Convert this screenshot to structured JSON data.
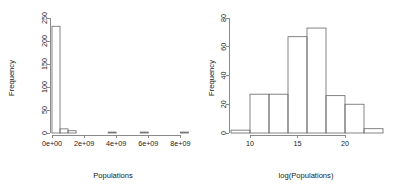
{
  "figure": {
    "background_color": "#ffffff",
    "axis_color": "#7d7d7d",
    "bar_outline_color": "#6f6f6f",
    "text_color": "#1a1a1a",
    "panel_count": 2
  },
  "chart_data": [
    {
      "type": "bar",
      "id": "histogram-populations",
      "title": "",
      "xlabel": "Populations",
      "ylabel": "Frequency",
      "grid": false,
      "legend": false,
      "xlim": [
        0,
        8600000000
      ],
      "ylim": [
        0,
        250
      ],
      "xticks": [
        0,
        2000000000,
        4000000000,
        6000000000,
        8000000000
      ],
      "xtick_labels": [
        "0e+00",
        "2e+09",
        "4e+09",
        "6e+09",
        "8e+09"
      ],
      "yticks": [
        0,
        50,
        100,
        150,
        200,
        250
      ],
      "ytick_labels": [
        "0",
        "50",
        "100",
        "150",
        "200",
        "250"
      ],
      "bin_width": 500000000,
      "bin_edges": [
        0,
        500000000,
        1000000000,
        1500000000,
        2000000000,
        2500000000,
        3000000000,
        3500000000,
        4000000000,
        4500000000,
        5000000000,
        5500000000,
        6000000000,
        6500000000,
        7000000000,
        7500000000,
        8000000000,
        8500000000
      ],
      "categories": [
        "0.0e+09",
        "0.5e+09",
        "1.0e+09",
        "1.5e+09",
        "2.0e+09",
        "2.5e+09",
        "3.0e+09",
        "3.5e+09",
        "4.0e+09",
        "4.5e+09",
        "5.0e+09",
        "5.5e+09",
        "6.0e+09",
        "6.5e+09",
        "7.0e+09",
        "7.5e+09",
        "8.0e+09"
      ],
      "values": [
        232,
        9,
        5,
        0,
        0,
        0,
        0,
        2,
        0,
        0,
        0,
        2,
        0,
        0,
        0,
        0,
        2
      ]
    },
    {
      "type": "bar",
      "id": "histogram-log-populations",
      "title": "",
      "xlabel": "log(Populations)",
      "ylabel": "Frequency",
      "grid": false,
      "legend": false,
      "xlim": [
        8,
        24
      ],
      "ylim": [
        0,
        80
      ],
      "xticks": [
        10,
        15,
        20
      ],
      "xtick_labels": [
        "10",
        "15",
        "20"
      ],
      "yticks": [
        0,
        20,
        40,
        60,
        80
      ],
      "ytick_labels": [
        "0",
        "20",
        "40",
        "60",
        "80"
      ],
      "bin_width": 2,
      "bin_edges": [
        8,
        10,
        12,
        14,
        16,
        18,
        20,
        22,
        24
      ],
      "categories": [
        "8-10",
        "10-12",
        "12-14",
        "14-16",
        "16-18",
        "18-20",
        "20-22",
        "22-24"
      ],
      "values": [
        2,
        27,
        27,
        67,
        73,
        26,
        20,
        3
      ]
    }
  ]
}
